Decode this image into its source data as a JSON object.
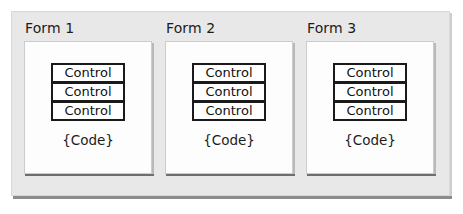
{
  "diagram": {
    "background_color": "#ffffff",
    "container": {
      "name": "application-container",
      "fill_color": "#e8e8e8",
      "border_color": "#d8d8d8",
      "shadow_color": "#8c8c8c"
    },
    "forms": [
      {
        "title": "Form 1",
        "panel_fill": "#fdfdfd",
        "panel_border": "#cccccc",
        "controls": [
          {
            "label": "Control"
          },
          {
            "label": "Control"
          },
          {
            "label": "Control"
          }
        ],
        "code_label": "{Code}"
      },
      {
        "title": "Form 2",
        "panel_fill": "#fdfdfd",
        "panel_border": "#cccccc",
        "controls": [
          {
            "label": "Control"
          },
          {
            "label": "Control"
          },
          {
            "label": "Control"
          }
        ],
        "code_label": "{Code}"
      },
      {
        "title": "Form 3",
        "panel_fill": "#fdfdfd",
        "panel_border": "#cccccc",
        "controls": [
          {
            "label": "Control"
          },
          {
            "label": "Control"
          },
          {
            "label": "Control"
          }
        ],
        "code_label": "{Code}"
      }
    ]
  }
}
